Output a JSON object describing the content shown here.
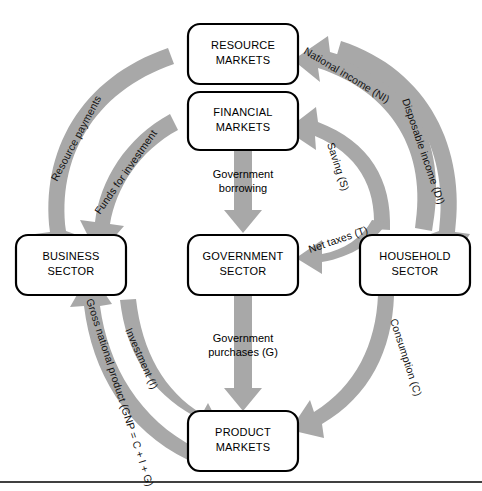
{
  "diagram": {
    "colors": {
      "arrow_fill": "#a8a8a8",
      "box_stroke": "#000000",
      "box_fill": "#ffffff",
      "text": "#000000",
      "rule": "#000000"
    },
    "nodes": [
      {
        "id": "resource-markets",
        "line1": "RESOURCE",
        "line2": "MARKETS"
      },
      {
        "id": "financial-markets",
        "line1": "FINANCIAL",
        "line2": "MARKETS"
      },
      {
        "id": "business-sector",
        "line1": "BUSINESS",
        "line2": "SECTOR"
      },
      {
        "id": "government-sector",
        "line1": "GOVERNMENT",
        "line2": "SECTOR"
      },
      {
        "id": "household-sector",
        "line1": "HOUSEHOLD",
        "line2": "SECTOR"
      },
      {
        "id": "product-markets",
        "line1": "PRODUCT",
        "line2": "MARKETS"
      }
    ],
    "flows": [
      {
        "id": "national-income",
        "label": "National income  (NI)",
        "from": "household-sector",
        "to": "resource-markets"
      },
      {
        "id": "resource-payments",
        "label": "Resource payments",
        "from": "resource-markets",
        "to": "business-sector"
      },
      {
        "id": "disposable-income",
        "label": "Disposable income (DI)",
        "from": "resource-markets",
        "to": "household-sector"
      },
      {
        "id": "saving",
        "label": "Saving (S)",
        "from": "household-sector",
        "to": "financial-markets"
      },
      {
        "id": "funds-for-investment",
        "label": "Funds for investment",
        "from": "financial-markets",
        "to": "business-sector"
      },
      {
        "id": "net-taxes",
        "label": "Net  taxes (T)",
        "from": "household-sector",
        "to": "government-sector"
      },
      {
        "id": "government-borrowing",
        "label": "Government\nborrowing",
        "from": "financial-markets",
        "to": "government-sector"
      },
      {
        "id": "government-purchases",
        "label": "Government\npurchases (G)",
        "from": "government-sector",
        "to": "product-markets"
      },
      {
        "id": "consumption",
        "label": "Consumption (C)",
        "from": "household-sector",
        "to": "product-markets"
      },
      {
        "id": "investment",
        "label": "Investment (I)",
        "from": "business-sector",
        "to": "product-markets"
      },
      {
        "id": "gross-national-product",
        "label": "Gross national product (GNP = C + I + G)",
        "from": "product-markets",
        "to": "business-sector"
      }
    ],
    "center_labels": {
      "gov_borrowing_line1": "Government",
      "gov_borrowing_line2": "borrowing",
      "gov_purchases_line1": "Government",
      "gov_purchases_line2": "purchases (G)"
    }
  }
}
